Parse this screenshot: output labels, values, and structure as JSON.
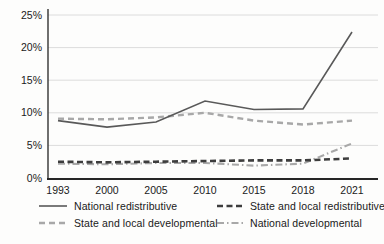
{
  "chart_data": {
    "type": "line",
    "title": "",
    "xlabel": "",
    "ylabel": "",
    "categories": [
      "1993",
      "2000",
      "2005",
      "2010",
      "2015",
      "2018",
      "2021"
    ],
    "y_ticks": [
      "0%",
      "5%",
      "10%",
      "15%",
      "20%",
      "25%"
    ],
    "ylim": [
      0,
      25
    ],
    "grid": "horizontal",
    "legend_position": "bottom",
    "series": [
      {
        "name": "National redistributive",
        "style": "solid",
        "color": "#595959",
        "width": 1.6,
        "values": [
          8.8,
          7.8,
          8.6,
          11.8,
          10.5,
          10.6,
          22.4
        ]
      },
      {
        "name": "State and local redistributive",
        "style": "dashed-bold",
        "color": "#3d3d3d",
        "width": 2.6,
        "values": [
          2.5,
          2.4,
          2.5,
          2.6,
          2.7,
          2.7,
          3.0
        ]
      },
      {
        "name": "State and local developmental",
        "style": "dashed",
        "color": "#a8a8a8",
        "width": 2.4,
        "values": [
          9.1,
          9.0,
          9.3,
          10.0,
          8.8,
          8.2,
          8.8
        ]
      },
      {
        "name": "National developmental",
        "style": "dash-dot",
        "color": "#a8a8a8",
        "width": 2.1,
        "values": [
          2.2,
          2.1,
          2.3,
          2.3,
          1.9,
          2.2,
          5.3
        ]
      }
    ],
    "colors": {
      "gridline": "#dcdcdc",
      "axis": "#333333",
      "tick_text": "#1a1a1a"
    }
  }
}
